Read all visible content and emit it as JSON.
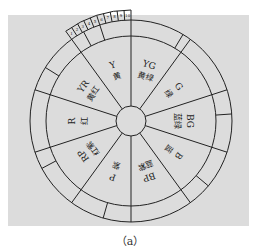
{
  "diagram": {
    "type": "hue-circle",
    "caption": "（a）",
    "scale_ticks": [
      "1",
      "2",
      "3",
      "4",
      "5",
      "6",
      "7",
      "8",
      "9",
      "10"
    ],
    "hues": [
      {
        "code": "Y",
        "name": "黄"
      },
      {
        "code": "YG",
        "name": "黄绿"
      },
      {
        "code": "G",
        "name": "绿"
      },
      {
        "code": "BG",
        "name": "蓝绿"
      },
      {
        "code": "B",
        "name": "蓝"
      },
      {
        "code": "BP",
        "name": "蓝紫"
      },
      {
        "code": "P",
        "name": "紫"
      },
      {
        "code": "RP",
        "name": "红紫"
      },
      {
        "code": "R",
        "name": "红"
      },
      {
        "code": "YR",
        "name": "黄红"
      }
    ],
    "colors": {
      "panel": "#dcdcdc",
      "line": "#222222",
      "background": "#ffffff"
    }
  }
}
